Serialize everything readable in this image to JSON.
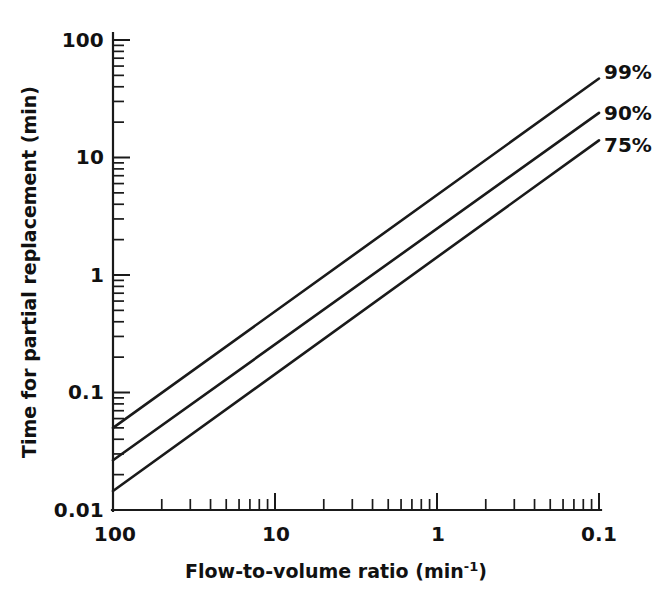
{
  "chart_data": {
    "type": "line",
    "title": "",
    "xlabel": "Flow-to-volume ratio (min-1)",
    "xlabel_base": "Flow-to-volume ratio (min",
    "xlabel_sup": "-1",
    "xlabel_tail": ")",
    "ylabel": "Time for partial replacement (min)",
    "xscale": "log",
    "yscale": "log",
    "x_direction": "decreasing",
    "xlim": [
      100,
      0.1
    ],
    "ylim": [
      0.01,
      100
    ],
    "grid": false,
    "legend_position": "right-end-of-lines",
    "xticks": [
      100,
      10,
      1,
      0.1
    ],
    "xtick_labels": [
      "100",
      "10",
      "1",
      "0.1"
    ],
    "yticks": [
      0.01,
      0.1,
      1,
      10,
      100
    ],
    "ytick_labels": [
      "0.01",
      "0.1",
      "1",
      "10",
      "100"
    ],
    "minor_tick_multipliers": [
      2,
      3,
      4,
      5,
      6,
      7,
      8,
      9
    ],
    "line_color": "#1a1a1a",
    "background_color": "#ffffff",
    "series": [
      {
        "name": "99%",
        "label": "99%",
        "x": [
          100,
          0.1
        ],
        "y": [
          0.05,
          47
        ],
        "endpoints_note": "straight line on log-log, slope -1"
      },
      {
        "name": "90%",
        "label": "90%",
        "x": [
          100,
          0.1
        ],
        "y": [
          0.0265,
          24
        ],
        "endpoints_note": "straight line on log-log, slope -1"
      },
      {
        "name": "75%",
        "label": "75%",
        "x": [
          100,
          0.1
        ],
        "y": [
          0.0145,
          14
        ],
        "endpoints_note": "straight line on log-log, slope -1"
      }
    ]
  },
  "axes": {
    "x_title": "Flow-to-volume ratio (min-1)",
    "y_title": "Time for partial replacement (min)"
  },
  "labels": {
    "p99": "99%",
    "p90": "90%",
    "p75": "75%",
    "x_100": "100",
    "x_10": "10",
    "x_1": "1",
    "x_0p1": "0.1",
    "y_100": "100",
    "y_10": "10",
    "y_1": "1",
    "y_0p1": "0.1",
    "y_0p01": "0.01"
  }
}
